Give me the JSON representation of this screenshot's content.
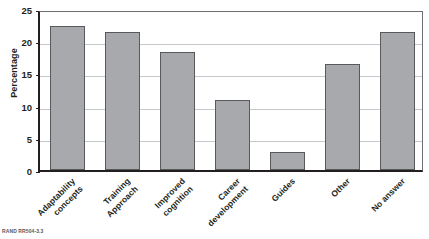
{
  "figure": {
    "source_note": "RAND RR504-3.3"
  },
  "chart_data": {
    "type": "bar",
    "title": "",
    "xlabel": "",
    "ylabel": "Percentage",
    "ylim": [
      0,
      25
    ],
    "yticks": [
      0,
      5,
      10,
      15,
      20,
      25
    ],
    "ytick_labels": [
      "0",
      "5",
      "10",
      "15",
      "20",
      "25"
    ],
    "grid": "horizontal",
    "legend": "none",
    "bar_color": "#a7a9ac",
    "bar_edge_color": "#58595b",
    "axis_color": "#231f20",
    "gridline_color": "#c7c8ca",
    "categories": [
      "Adaptability\nconcepts",
      "Training\nApproach",
      "Improved\ncognition",
      "Career\ndevelopment",
      "Guides",
      "Other",
      "No answer"
    ],
    "values": [
      22.4,
      21.5,
      18.3,
      10.8,
      2.8,
      16.5,
      21.4
    ]
  }
}
